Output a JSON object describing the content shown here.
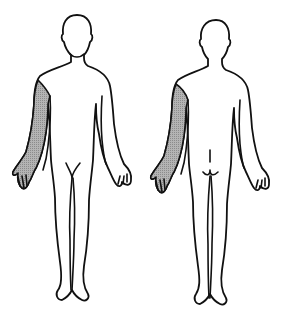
{
  "diagram": {
    "type": "body-chart",
    "views": [
      {
        "name": "front",
        "shaded_regions": [
          "right-arm",
          "right-hand"
        ]
      },
      {
        "name": "back",
        "shaded_regions": [
          "right-arm",
          "right-hand"
        ]
      }
    ],
    "colors": {
      "outline": "#111111",
      "shade": "#a8a8a8",
      "background": "#ffffff"
    }
  }
}
